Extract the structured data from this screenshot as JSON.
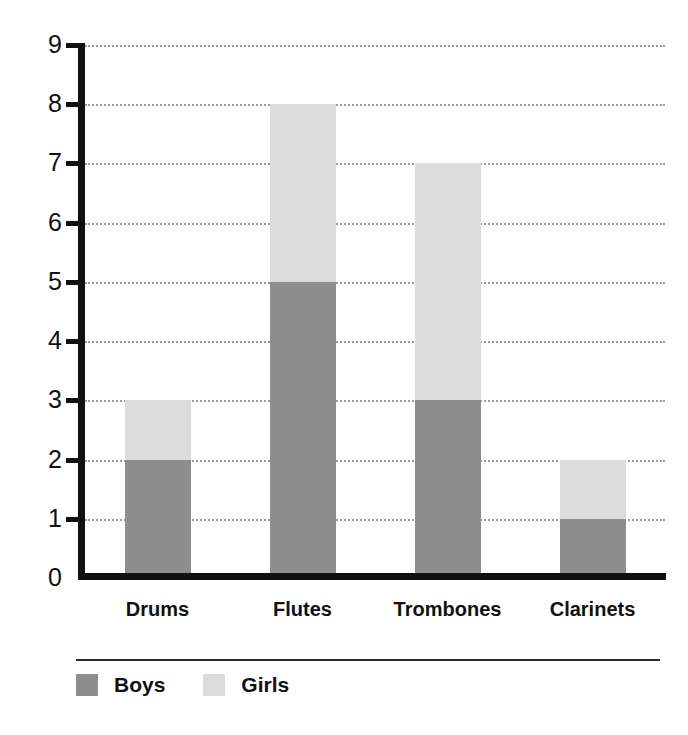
{
  "chart_data": {
    "type": "bar",
    "stacked": true,
    "title": "",
    "subtitle": "",
    "xlabel": "",
    "ylabel": "",
    "categories": [
      "Drums",
      "Flutes",
      "Trombones",
      "Clarinets"
    ],
    "series": [
      {
        "name": "Boys",
        "color": "#8d8d8d",
        "values": [
          2,
          5,
          3,
          1
        ]
      },
      {
        "name": "Girls",
        "color": "#dcdcdc",
        "values": [
          1,
          3,
          4,
          1
        ]
      }
    ],
    "totals": [
      3,
      8,
      7,
      2
    ],
    "ylim": [
      0,
      9
    ],
    "ytick_labels": [
      "0",
      "1",
      "2",
      "3",
      "4",
      "5",
      "6",
      "7",
      "8",
      "9"
    ],
    "ytick_values": [
      0,
      1,
      2,
      3,
      4,
      5,
      6,
      7,
      8,
      9
    ],
    "grid": true,
    "grid_style": "dotted",
    "grid_axis": "y",
    "legend_position": "bottom-left",
    "axis_color": "#111111",
    "background_color": "#ffffff"
  },
  "legend": {
    "entries": [
      {
        "label": "Boys",
        "color": "#8d8d8d"
      },
      {
        "label": "Girls",
        "color": "#dcdcdc"
      }
    ]
  }
}
